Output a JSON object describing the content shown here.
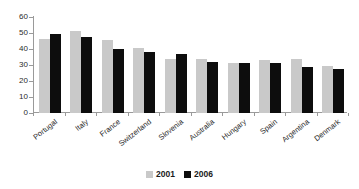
{
  "chart_data": {
    "type": "bar",
    "title": "",
    "subtitle": "",
    "xlabel": "",
    "ylabel": "",
    "ylim": [
      0,
      60
    ],
    "yticks": [
      0,
      10,
      20,
      30,
      40,
      50,
      60
    ],
    "grid": false,
    "legend_position": "bottom",
    "categories": [
      "Portugal",
      "Italy",
      "France",
      "Switzerland",
      "Slovenia",
      "Australia",
      "Hungary",
      "Spain",
      "Argentina",
      "Denmark"
    ],
    "series": [
      {
        "name": "2001",
        "color": "#c9c9c9",
        "values": [
          46.5,
          51.5,
          45.5,
          40.5,
          34,
          34,
          31,
          33,
          34,
          29.5
        ]
      },
      {
        "name": "2006",
        "color": "#0d0d0d",
        "values": [
          49.5,
          47.5,
          40,
          38,
          37,
          32,
          31,
          31,
          28.5,
          27.5
        ]
      }
    ]
  },
  "legend": {
    "entries": [
      {
        "label": "2001",
        "swatch": "legend-swatch-2001"
      },
      {
        "label": "2006",
        "swatch": "legend-swatch-2006"
      }
    ]
  },
  "colors": {
    "series_2001": "#c9c9c9",
    "series_2006": "#0d0d0d",
    "axis": "#9a9a9a",
    "text": "#1a1a1a",
    "background": "#ffffff"
  }
}
